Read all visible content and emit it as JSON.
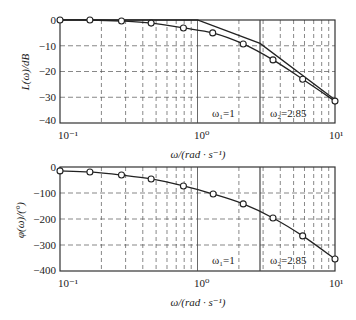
{
  "chart_data": [
    {
      "type": "line",
      "title": "",
      "xscale": "log",
      "xlabel": "ω/(rad · s⁻¹)",
      "ylabel": "L(ω)/dB",
      "xlim": [
        0.1,
        10
      ],
      "ylim": [
        -40,
        0
      ],
      "yticks": [
        0,
        -10,
        -20,
        -30,
        -40
      ],
      "xticks": [
        "10⁻¹",
        "10⁰",
        "10¹"
      ],
      "grid": true,
      "annotations": [
        "ω₁=1",
        "ω₂=2.85"
      ],
      "series": [
        {
          "name": "Actual magnitude (with markers)",
          "x": [
            0.1,
            0.165,
            0.28,
            0.46,
            0.79,
            1.29,
            2.15,
            3.54,
            5.82,
            10
          ],
          "y": [
            0,
            0,
            -0.4,
            -1.2,
            -3.1,
            -5,
            -9.3,
            -15.5,
            -23,
            -31.5
          ]
        },
        {
          "name": "Asymptotic magnitude",
          "x": [
            0.1,
            1,
            2.85,
            10
          ],
          "y": [
            0,
            0,
            -9.1,
            -31
          ]
        }
      ]
    },
    {
      "type": "line",
      "title": "",
      "xscale": "log",
      "xlabel": "ω/(rad · s⁻¹)",
      "ylabel": "φ(ω)/(°)",
      "xlim": [
        0.1,
        10
      ],
      "ylim": [
        -400,
        0
      ],
      "yticks": [
        0,
        -100,
        -200,
        -300,
        -400
      ],
      "xticks": [
        "10⁻¹",
        "10⁰",
        "10¹"
      ],
      "grid": true,
      "annotations": [
        "ω₁=1",
        "ω₂=2.85"
      ],
      "series": [
        {
          "name": "Phase",
          "x": [
            0.1,
            0.165,
            0.28,
            0.46,
            0.79,
            1.3,
            2.15,
            3.54,
            5.82,
            10
          ],
          "y": [
            -15,
            -19,
            -31,
            -46,
            -73,
            -104,
            -142,
            -196,
            -265,
            -354
          ]
        }
      ]
    }
  ],
  "labels": {
    "mag_ylabel": "L(ω)/dB",
    "phase_ylabel": "φ(ω)/(°)",
    "xlabel": "ω/(rad · s⁻¹)",
    "w1": "ω₁=1",
    "w2": "ω₂=2.85",
    "xt0": "10⁻¹",
    "xt1": "10⁰",
    "xt2": "10¹",
    "mag_yticks": [
      "0",
      "−10",
      "−20",
      "−30",
      "−40"
    ],
    "phase_yticks": [
      "0",
      "−100",
      "−200",
      "−300",
      "−400"
    ]
  }
}
